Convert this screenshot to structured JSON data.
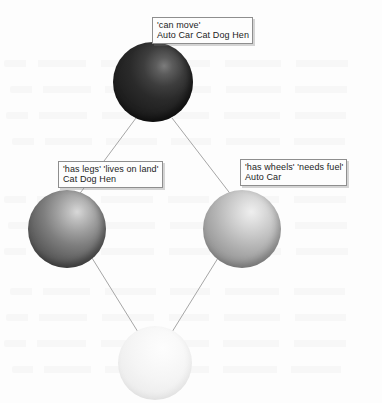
{
  "diagram": {
    "type": "concept-lattice",
    "title_visible": false,
    "background_color": "#fdfdfd",
    "edge_color": "#a0a0a0",
    "nodes": [
      {
        "id": "top",
        "role": "top-concept",
        "shape": "sphere",
        "shade": "dark",
        "color": "#2a2a2a",
        "center_x": 153,
        "center_y": 82,
        "diameter": 80
      },
      {
        "id": "left",
        "role": "animal-concept",
        "shape": "sphere",
        "shade": "medium-dark",
        "color": "#7e7e7e",
        "center_x": 67,
        "center_y": 229,
        "diameter": 78
      },
      {
        "id": "right",
        "role": "vehicle-concept",
        "shape": "sphere",
        "shade": "medium-light",
        "color": "#b4b4b4",
        "center_x": 242,
        "center_y": 229,
        "diameter": 78
      },
      {
        "id": "bottom",
        "role": "bottom-concept",
        "shape": "sphere",
        "shade": "very-light",
        "color": "#f2f2f2",
        "center_x": 155,
        "center_y": 363,
        "diameter": 74
      }
    ],
    "edges": [
      {
        "from": "top",
        "to": "left"
      },
      {
        "from": "top",
        "to": "right"
      },
      {
        "from": "left",
        "to": "bottom"
      },
      {
        "from": "right",
        "to": "bottom"
      }
    ],
    "labels": [
      {
        "id": "label-top",
        "node": "top",
        "attributes": "'can move'",
        "objects": "Auto Car Cat Dog Hen"
      },
      {
        "id": "label-left",
        "node": "left",
        "attributes": "'has legs' 'lives on land'",
        "objects": "Cat Dog Hen"
      },
      {
        "id": "label-right",
        "node": "right",
        "attributes": "'has wheels' 'needs fuel'",
        "objects": "Auto Car"
      }
    ]
  }
}
